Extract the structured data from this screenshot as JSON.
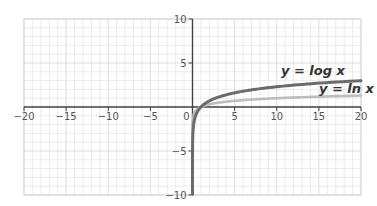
{
  "chart_data": {
    "type": "line",
    "title": "",
    "xlabel": "",
    "ylabel": "",
    "xlim": [
      -20,
      20
    ],
    "ylim": [
      -10,
      10
    ],
    "grid": true,
    "grid_step": 1,
    "x_ticks": [
      -20,
      -15,
      -10,
      -5,
      0,
      5,
      10,
      15,
      20
    ],
    "x_tick_labels": [
      "−20",
      "−15",
      "−10",
      "−5",
      "0",
      "5",
      "10",
      "15",
      "20"
    ],
    "y_ticks": [
      10,
      5,
      -5,
      -10
    ],
    "y_tick_labels": [
      "10",
      "5",
      "−5",
      "−10"
    ],
    "series": [
      {
        "name": "y = log x",
        "label": "y = log x",
        "color": "#6b6b6b",
        "function": "ln",
        "x": [
          0.01,
          0.5,
          1,
          2,
          3,
          5,
          10,
          15,
          20
        ],
        "values": [
          -4.6,
          -0.69,
          0,
          0.69,
          1.1,
          1.61,
          2.3,
          2.71,
          3.0
        ]
      },
      {
        "name": "y = ln x",
        "label": "y = ln x",
        "color": "#bdbdbd",
        "function": "log10",
        "x": [
          1e-10,
          0.5,
          1,
          2,
          3,
          5,
          10,
          15,
          20
        ],
        "values": [
          -10,
          -0.3,
          0,
          0.3,
          0.48,
          0.7,
          1.0,
          1.18,
          1.3
        ]
      }
    ],
    "annotations": [
      {
        "text": "y = log x",
        "x": 10.5,
        "y": 3.6
      },
      {
        "text": "y = ln x",
        "x": 15,
        "y": 1.6
      }
    ]
  }
}
